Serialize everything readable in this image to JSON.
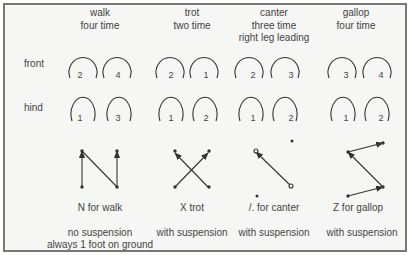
{
  "row_labels": {
    "front": "front",
    "hind": "hind"
  },
  "gaits": [
    {
      "name": "walk",
      "header": [
        "walk",
        "four time"
      ],
      "front": [
        "2",
        "4"
      ],
      "hind": [
        "1",
        "3"
      ],
      "pattern_label": "N for walk",
      "suspension": [
        "no suspension",
        "always 1 foot on ground"
      ]
    },
    {
      "name": "trot",
      "header": [
        "trot",
        "two time"
      ],
      "front": [
        "2",
        "1"
      ],
      "hind": [
        "1",
        "2"
      ],
      "pattern_label": "X trot",
      "suspension": [
        "with suspension"
      ]
    },
    {
      "name": "canter",
      "header": [
        "canter",
        "three time",
        "right leg leading"
      ],
      "front": [
        "2",
        "3"
      ],
      "hind": [
        "1",
        "2"
      ],
      "pattern_label": "/. for canter",
      "suspension": [
        "with suspension"
      ]
    },
    {
      "name": "gallop",
      "header": [
        "gallop",
        "four time"
      ],
      "front": [
        "3",
        "4"
      ],
      "hind": [
        "1",
        "2"
      ],
      "pattern_label": "Z for gallop",
      "suspension": [
        "with suspension"
      ]
    }
  ],
  "colors": {
    "border": "#777777",
    "ink": "#3a3a3a",
    "background": "#f6f6f4"
  }
}
